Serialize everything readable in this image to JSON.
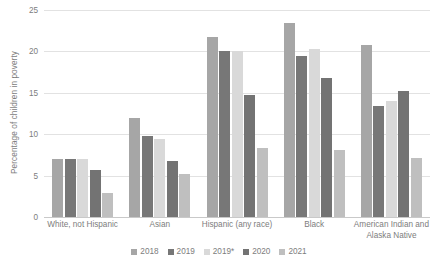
{
  "chart_data": {
    "type": "bar",
    "title": "",
    "xlabel": "",
    "ylabel": "Percentage of children in poverty",
    "ylim": [
      0,
      25
    ],
    "yticks": [
      0,
      5,
      10,
      15,
      20,
      25
    ],
    "grid": true,
    "legend_position": "bottom",
    "categories": [
      "White, not Hispanic",
      "Asian",
      "Hispanic (any race)",
      "Black",
      "American Indian and\nAlaska Native"
    ],
    "category_lines": [
      [
        "White, not Hispanic"
      ],
      [
        "Asian"
      ],
      [
        "Hispanic (any race)"
      ],
      [
        "Black"
      ],
      [
        "American Indian and",
        "Alaska Native"
      ]
    ],
    "series": [
      {
        "name": "2018",
        "color": "#a6a6a6",
        "values": [
          7.0,
          12.0,
          21.7,
          23.4,
          20.8
        ]
      },
      {
        "name": "2019",
        "color": "#777777",
        "values": [
          7.0,
          9.8,
          20.0,
          19.4,
          13.4
        ]
      },
      {
        "name": "2019*",
        "color": "#d9d9d9",
        "values": [
          7.0,
          9.4,
          20.1,
          20.3,
          14.0
        ]
      },
      {
        "name": "2020",
        "color": "#737373",
        "values": [
          5.7,
          6.8,
          14.7,
          16.8,
          15.2
        ]
      },
      {
        "name": "2021",
        "color": "#bfbfbf",
        "values": [
          2.9,
          5.2,
          8.3,
          8.1,
          7.1
        ]
      }
    ]
  },
  "colors": {
    "gridline": "#e2e2e2",
    "axis": "#c9c9c9",
    "text": "#7d7d7d",
    "background": "#ffffff"
  }
}
